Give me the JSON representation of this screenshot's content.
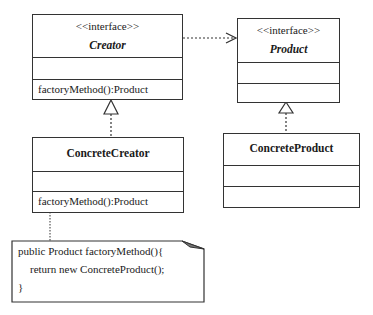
{
  "diagram": {
    "type": "UML class diagram - Factory Method pattern",
    "classes": [
      {
        "id": "creator",
        "stereotype": "<<interface>>",
        "name": "Creator",
        "attributes": [],
        "methods": [
          "factoryMethod():Product"
        ]
      },
      {
        "id": "product",
        "stereotype": "<<interface>>",
        "name": "Product",
        "attributes": [],
        "methods": []
      },
      {
        "id": "concrete_creator",
        "name": "ConcreteCreator",
        "attributes": [],
        "methods": [
          "factoryMethod():Product"
        ]
      },
      {
        "id": "concrete_product",
        "name": "ConcreteProduct",
        "attributes": [],
        "methods": []
      }
    ],
    "relations": [
      {
        "from": "creator",
        "to": "product",
        "type": "dependency"
      },
      {
        "from": "concrete_creator",
        "to": "creator",
        "type": "realization"
      },
      {
        "from": "concrete_product",
        "to": "product",
        "type": "realization"
      },
      {
        "from": "note",
        "to": "concrete_creator",
        "type": "note-anchor"
      }
    ],
    "note": {
      "lines": [
        "public Product factoryMethod(){",
        "return new ConcreteProduct();",
        "}"
      ]
    }
  },
  "colors": {
    "line": "#333333",
    "background": "#ffffff",
    "text": "#1a1a1a"
  }
}
